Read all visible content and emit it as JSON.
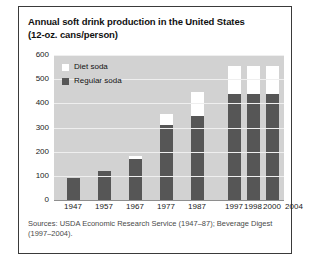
{
  "chart_data": {
    "type": "bar",
    "subtype": "stacked-bar",
    "title": "Annual soft drink production in the United States",
    "subtitle": "(12-oz. cans/person)",
    "xlabel": "",
    "ylabel": "",
    "ylim": [
      0,
      600
    ],
    "yticks": [
      600,
      500,
      400,
      300,
      200,
      100,
      0
    ],
    "grid": true,
    "legend_position": "top-left",
    "categories": [
      "1947",
      "1957",
      "1967",
      "1977",
      "1987",
      "1997",
      "1998",
      "2000",
      "2004"
    ],
    "series": [
      {
        "name": "Regular soda",
        "color": "#565656",
        "values": [
          90,
          122,
          171,
          311,
          347,
          437,
          437,
          437,
          388
        ]
      },
      {
        "name": "Diet soda",
        "color": "#ffffff",
        "values": [
          0,
          0,
          12,
          45,
          100,
          118,
          118,
          118,
          149
        ]
      }
    ],
    "totals": [
      90,
      122,
      183,
      356,
      447,
      555,
      555,
      555,
      537
    ],
    "source": "Sources: USDA Economic Research Service (1947–87); Beverage Digest (1997–2004)."
  },
  "title": {
    "line1": "Annual soft drink production in the United States",
    "line2": "(12-oz. cans/person)"
  },
  "legend": {
    "items": [
      {
        "label": "Diet soda",
        "swatch": "diet"
      },
      {
        "label": "Regular soda",
        "swatch": "regular"
      }
    ]
  },
  "source": {
    "line1": "Sources: USDA Economic Research Service (1947–87); Beverage Digest",
    "line2": "(1997–2004)."
  },
  "colors": {
    "regular_soda": "#565656",
    "diet_soda": "#ffffff",
    "plot_background": "#d2d2d2",
    "gridline": "#efefef",
    "border": "#3a3a3a"
  }
}
